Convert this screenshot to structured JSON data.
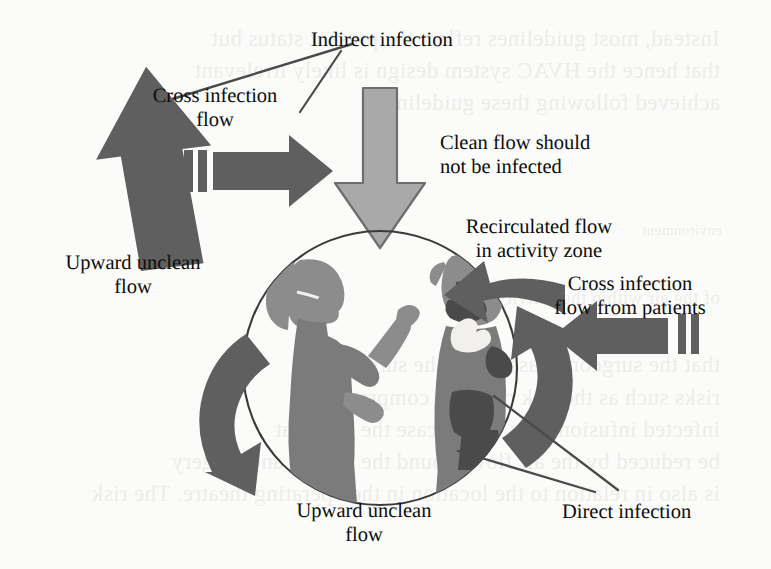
{
  "figure": {
    "background_color": "#fbfbf9",
    "ink_color": "#0d0d0d"
  },
  "palette": {
    "dark_arrow": "#5f5f5f",
    "light_arrow": "#a9a9a9",
    "light_arrow_outline": "#6e6e6e",
    "figure_light": "#8c8c8c",
    "figure_mid": "#7b7b7b",
    "figure_dark": "#4a4a4a",
    "circle_outline": "#3a3a3a",
    "leader_line": "#4a4a4a"
  },
  "labels": [
    {
      "id": "indirect-infection",
      "lines": [
        "Indirect infection"
      ],
      "x": 311,
      "y": 28,
      "align": "left"
    },
    {
      "id": "cross-infection-flow",
      "lines": [
        "Cross infection",
        "flow"
      ],
      "x": 215,
      "y": 84,
      "align": "center"
    },
    {
      "id": "clean-flow",
      "lines": [
        "Clean flow should",
        "not be infected"
      ],
      "x": 440,
      "y": 131,
      "align": "left"
    },
    {
      "id": "upward-unclean-left",
      "lines": [
        "Upward unclean",
        "flow"
      ],
      "x": 133,
      "y": 251,
      "align": "center"
    },
    {
      "id": "recirculated-flow",
      "lines": [
        "Recirculated flow",
        "in activity zone"
      ],
      "x": 539,
      "y": 215,
      "align": "center"
    },
    {
      "id": "cross-infection-patients",
      "lines": [
        "Cross infection",
        "flow from patients"
      ],
      "x": 630,
      "y": 272,
      "align": "center"
    },
    {
      "id": "upward-unclean-bottom",
      "lines": [
        "Upward unclean",
        "flow"
      ],
      "x": 364,
      "y": 499,
      "align": "center"
    },
    {
      "id": "direct-infection",
      "lines": [
        "Direct infection"
      ],
      "x": 562,
      "y": 500,
      "align": "left"
    }
  ],
  "arrows": [
    {
      "id": "upward-unclean-arrow-left",
      "kind": "straight",
      "direction": "up",
      "shade": "dark",
      "note": "large tilted arrow rising at upper left"
    },
    {
      "id": "cross-infection-arrow",
      "kind": "straight",
      "direction": "right",
      "shade": "dark",
      "note": "horizontal arrow with two tail bars"
    },
    {
      "id": "clean-flow-arrow",
      "kind": "straight",
      "direction": "down",
      "shade": "light",
      "note": "wide outlined arrow descending into the zone"
    },
    {
      "id": "cross-infection-patients-arrow",
      "kind": "straight",
      "direction": "left",
      "shade": "dark",
      "note": "arrow entering from the right with two tail bars"
    },
    {
      "id": "recirculated-flow-arrow-top-right",
      "kind": "curved",
      "direction": "counterclockwise",
      "shade": "dark",
      "note": "curved arrow at upper right of circle"
    },
    {
      "id": "recirculated-flow-arrow-right",
      "kind": "curved",
      "direction": "up",
      "shade": "dark",
      "note": "curved arrow at lower right of circle"
    },
    {
      "id": "upward-unclean-arrow-bottom-left",
      "kind": "curved",
      "direction": "up",
      "shade": "dark",
      "note": "curved arrow at lower left of circle"
    }
  ],
  "leader_lines": [
    {
      "id": "leader-indirect-infection-a",
      "from": "arrow-tip-upper-left",
      "to": "indirect-infection-label"
    },
    {
      "id": "leader-indirect-infection-b",
      "from": "cross-infection-arrow",
      "to": "indirect-infection-label"
    },
    {
      "id": "leader-direct-infection-a",
      "from": "activity-zone",
      "to": "direct-infection-label"
    },
    {
      "id": "leader-direct-infection-b",
      "from": "patient-figure",
      "to": "direct-infection-label"
    }
  ],
  "activity_zone": {
    "id": "activity-zone-circle",
    "center_x": 380,
    "center_y": 368,
    "radius": 138,
    "contents": [
      {
        "id": "caregiver-figure",
        "description": "masked caregiver in profile facing right with raised arms"
      },
      {
        "id": "patient-figure",
        "description": "masked patient facing left, darker tone"
      }
    ]
  },
  "ghost_text": [
    {
      "id": "ghost-1",
      "text": "Instead, most guidelines reflect the present status but",
      "x": 20,
      "y": 26,
      "size": 23
    },
    {
      "id": "ghost-2",
      "text": "that hence the HVAC system design is likely irrelevant",
      "x": 20,
      "y": 58,
      "size": 23
    },
    {
      "id": "ghost-3",
      "text": "achieved following these guidelines.",
      "x": 20,
      "y": 90,
      "size": 23
    },
    {
      "id": "ghost-4",
      "text": "environment",
      "x": 22,
      "y": 222,
      "size": 15
    },
    {
      "id": "ghost-5",
      "text": "of the air within the activity zone",
      "x": 20,
      "y": 287,
      "size": 19
    },
    {
      "id": "ghost-6",
      "text": "that the surgeon is assuming the surgery",
      "x": 20,
      "y": 352,
      "size": 23
    },
    {
      "id": "ghost-7",
      "text": "risks such as the risk of being compromised",
      "x": 20,
      "y": 385,
      "size": 23
    },
    {
      "id": "ghost-8",
      "text": "infected infusion; it is in this case the rule that",
      "x": 20,
      "y": 417,
      "size": 23
    },
    {
      "id": "ghost-9",
      "text": "be reduced by the air flow around the patient and surgery",
      "x": 20,
      "y": 449,
      "size": 23
    },
    {
      "id": "ghost-10",
      "text": "is also in relation to the location in the operating theatre. The risk",
      "x": 20,
      "y": 481,
      "size": 23
    }
  ]
}
